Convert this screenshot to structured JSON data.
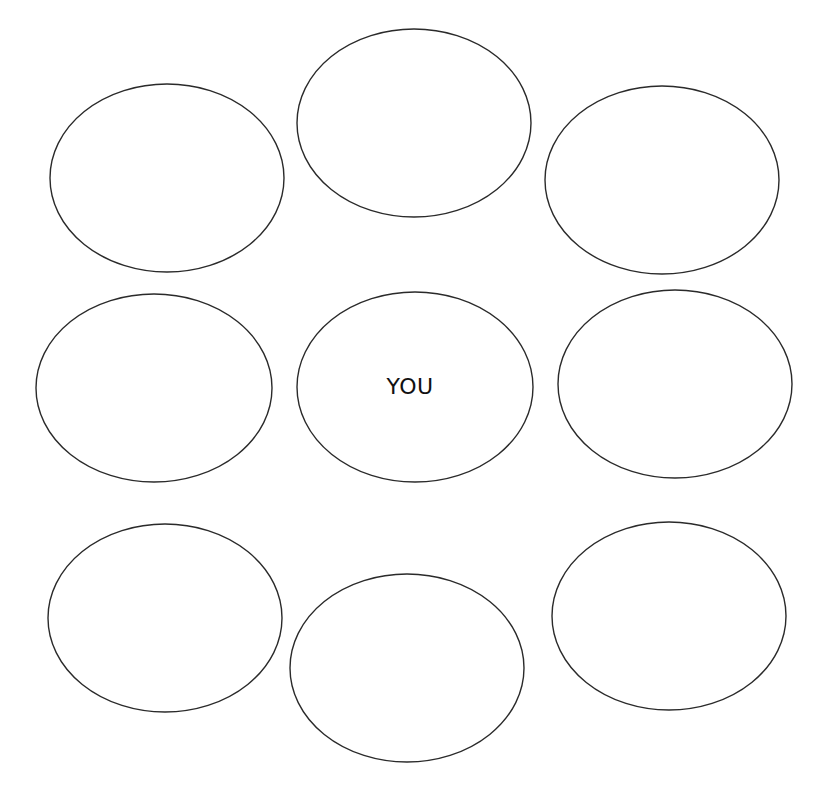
{
  "diagram": {
    "type": "circle-grid",
    "background": "#ffffff",
    "stroke_color": "#2a2a2a",
    "center_label": "YOU",
    "nodes": [
      {
        "id": "top-left",
        "cx": 167,
        "cy": 178,
        "rx": 117,
        "ry": 94,
        "label": ""
      },
      {
        "id": "top-center",
        "cx": 414,
        "cy": 123,
        "rx": 117,
        "ry": 94,
        "label": ""
      },
      {
        "id": "top-right",
        "cx": 662,
        "cy": 180,
        "rx": 117,
        "ry": 94,
        "label": ""
      },
      {
        "id": "middle-left",
        "cx": 154,
        "cy": 388,
        "rx": 118,
        "ry": 94,
        "label": ""
      },
      {
        "id": "center",
        "cx": 415,
        "cy": 387,
        "rx": 118,
        "ry": 95,
        "label": "YOU"
      },
      {
        "id": "middle-right",
        "cx": 675,
        "cy": 384,
        "rx": 117,
        "ry": 94,
        "label": ""
      },
      {
        "id": "bottom-left",
        "cx": 165,
        "cy": 618,
        "rx": 117,
        "ry": 94,
        "label": ""
      },
      {
        "id": "bottom-center",
        "cx": 407,
        "cy": 668,
        "rx": 117,
        "ry": 94,
        "label": ""
      },
      {
        "id": "bottom-right",
        "cx": 669,
        "cy": 616,
        "rx": 117,
        "ry": 94,
        "label": ""
      }
    ]
  }
}
